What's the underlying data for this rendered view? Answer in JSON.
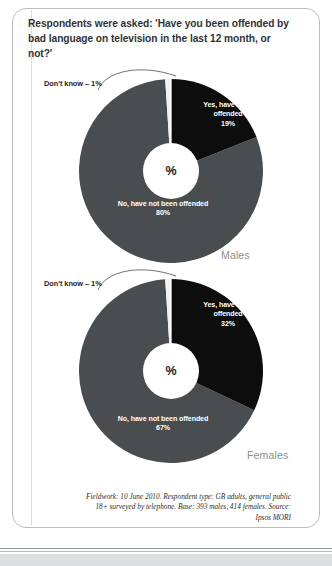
{
  "title": "Respondents were asked: 'Have you been offended by bad language on television in the last 12 month, or not?'",
  "hub_symbol": "%",
  "footnote": "Fieldwork: 10 June 2010. Respondent type: GB adults, general public 18+ surveyed by telephone. Base: 393 males, 414 females. Source: Ipsos MORI",
  "colors": {
    "yes_slice": "#0d0d0d",
    "no_slice": "#4a4d50",
    "dont_know_slice": "#f2f2f2",
    "hub": "#ffffff",
    "title_text": "#2f3337",
    "gender_text": "#8b8f93",
    "frame": "#b9bcc0"
  },
  "charts": [
    {
      "id": "males",
      "gender_label": "Males",
      "callout": {
        "label": "Don't know – 1%",
        "value": 1
      },
      "slices": [
        {
          "key": "yes",
          "label_line1": "Yes, have been",
          "label_line2": "offended",
          "label_value": "19%",
          "value": 19
        },
        {
          "key": "no",
          "label_line1": "No, have not been offended",
          "label_line2": "",
          "label_value": "80%",
          "value": 80
        },
        {
          "key": "dont_know",
          "label_line1": "Don't know",
          "label_line2": "",
          "label_value": "1%",
          "value": 1
        }
      ]
    },
    {
      "id": "females",
      "gender_label": "Females",
      "callout": {
        "label": "Don't know – 1%",
        "value": 1
      },
      "slices": [
        {
          "key": "yes",
          "label_line1": "Yes, have been",
          "label_line2": "offended",
          "label_value": "32%",
          "value": 32
        },
        {
          "key": "no",
          "label_line1": "No, have not been offended",
          "label_line2": "",
          "label_value": "67%",
          "value": 67
        },
        {
          "key": "dont_know",
          "label_line1": "Don't know",
          "label_line2": "",
          "label_value": "1%",
          "value": 1
        }
      ]
    }
  ],
  "chart_data": [
    {
      "type": "pie",
      "title": "Males",
      "categories": [
        "Yes, have been offended",
        "No, have not been offended",
        "Don't know"
      ],
      "values": [
        19,
        80,
        1
      ],
      "unit": "%",
      "colors": [
        "#0d0d0d",
        "#4a4d50",
        "#f2f2f2"
      ],
      "legend": "labels on slices",
      "annotations": [
        "Don't know – 1%"
      ],
      "center_label": "%"
    },
    {
      "type": "pie",
      "title": "Females",
      "categories": [
        "Yes, have been offended",
        "No, have not been offended",
        "Don't know"
      ],
      "values": [
        32,
        67,
        1
      ],
      "unit": "%",
      "colors": [
        "#0d0d0d",
        "#4a4d50",
        "#f2f2f2"
      ],
      "legend": "labels on slices",
      "annotations": [
        "Don't know – 1%"
      ],
      "center_label": "%"
    }
  ]
}
